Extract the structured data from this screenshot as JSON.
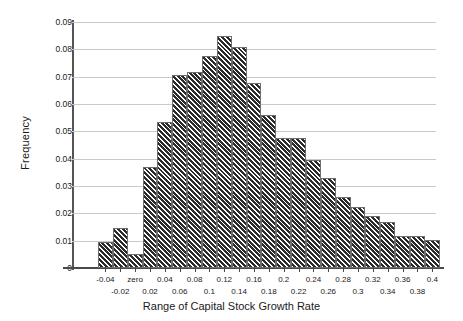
{
  "chart_data": {
    "type": "bar",
    "title": "",
    "xlabel": "Range of Capital Stock Growth Rate",
    "ylabel": "Frequency",
    "ylim": [
      0,
      0.09
    ],
    "ytick_labels": [
      "0",
      "0.01",
      "0.02",
      "0.03",
      "0.04",
      "0.05",
      "0.06",
      "0.07",
      "0.08",
      "0.09"
    ],
    "ytick_values": [
      0,
      0.01,
      0.02,
      0.03,
      0.04,
      0.05,
      0.06,
      0.07,
      0.08,
      0.09
    ],
    "grid": true,
    "legend": "none",
    "xtick_labels": [
      "-0.04",
      "-0.02",
      "zero",
      "0.02",
      "0.04",
      "0.06",
      "0.08",
      "0.1",
      "0.12",
      "0.14",
      "0.16",
      "0.18",
      "0.2",
      "0.22",
      "0.24",
      "0.26",
      "0.28",
      "0.3",
      "0.32",
      "0.34",
      "0.36",
      "0.38",
      "0.4"
    ],
    "categories": [
      "-0.04",
      "-0.02",
      "zero",
      "0.02",
      "0.04",
      "0.06",
      "0.08",
      "0.1",
      "0.12",
      "0.14",
      "0.16",
      "0.18",
      "0.2",
      "0.22",
      "0.24",
      "0.26",
      "0.28",
      "0.3",
      "0.32",
      "0.34",
      "0.36",
      "0.38",
      "0.4"
    ],
    "values": [
      0.0095,
      0.0148,
      0.005,
      0.0368,
      0.0533,
      0.0705,
      0.0718,
      0.0777,
      0.085,
      0.081,
      0.0677,
      0.056,
      0.0477,
      0.0477,
      0.0397,
      0.033,
      0.026,
      0.0224,
      0.0191,
      0.017,
      0.0116,
      0.0116,
      0.0102
    ],
    "bar_fill": "#2b2b2b",
    "bar_hatch": "diagonal-stripes",
    "bar_edge_color": "#6e6e6e",
    "grid_color": "#c9c9c9",
    "axis_color": "#4a4a4a"
  }
}
